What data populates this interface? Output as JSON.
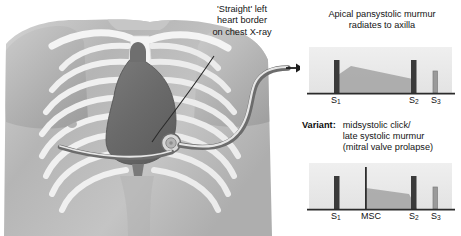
{
  "annotation": {
    "text": "'Straight' left\nheart border\non chest X-ray"
  },
  "anatomy": {
    "region_name": "anterior chest wall with heart silhouette",
    "stethoscope_position_label": "apex",
    "colors": {
      "skin": "#b9b9b9",
      "bone": "#f2f2f2",
      "heart": "#6e6e6e",
      "outline": "#4a4a4a"
    }
  },
  "panels": [
    {
      "id": "top",
      "title": "Apical pansystolic murmur\nradiates to axilla",
      "axis_labels": [
        {
          "text": "S",
          "sub": "1",
          "x": 26
        },
        {
          "text": "S",
          "sub": "2",
          "x": 104
        },
        {
          "text": "S",
          "sub": "3",
          "x": 126
        }
      ]
    },
    {
      "id": "bottom",
      "variant_label": "Variant:",
      "title": "midsystolic click/\nlate systolic murmur\n(mitral valve prolapse)",
      "axis_labels": [
        {
          "text": "S",
          "sub": "1",
          "x": 26
        },
        {
          "text": "MSC",
          "sub": "",
          "x": 56
        },
        {
          "text": "S",
          "sub": "2",
          "x": 104
        },
        {
          "text": "S",
          "sub": "3",
          "x": 126
        }
      ]
    }
  ],
  "chart_data": [
    {
      "type": "area",
      "id": "phonocardiogram-pansystolic",
      "title": "Apical pansystolic murmur radiates to axilla",
      "xlabel": "",
      "ylabel": "",
      "grid": false,
      "legend": "none",
      "xlim": [
        0,
        152
      ],
      "ylim": [
        0,
        48
      ],
      "baseline_y": 46,
      "events": [
        {
          "name": "S1",
          "x": 29,
          "width": 5.5,
          "height": 33,
          "shade": "#3a3a3a"
        },
        {
          "name": "S2",
          "x": 106,
          "width": 5.5,
          "height": 33,
          "shade": "#3a3a3a"
        },
        {
          "name": "S3",
          "x": 128,
          "width": 4.5,
          "height": 22,
          "shade": "#9a9a9a"
        }
      ],
      "murmur": {
        "name": "pansystolic murmur envelope",
        "shade": "#a8a8a8",
        "points": [
          [
            30,
            46
          ],
          [
            30,
            30
          ],
          [
            46,
            19
          ],
          [
            108,
            32
          ],
          [
            110,
            46
          ]
        ]
      }
    },
    {
      "type": "area",
      "id": "phonocardiogram-midsystolic-click",
      "title": "Variant: midsystolic click / late systolic murmur (mitral valve prolapse)",
      "xlabel": "",
      "ylabel": "",
      "grid": false,
      "legend": "none",
      "xlim": [
        0,
        152
      ],
      "ylim": [
        0,
        48
      ],
      "baseline_y": 46,
      "events": [
        {
          "name": "S1",
          "x": 29,
          "width": 5.5,
          "height": 33,
          "shade": "#3a3a3a"
        },
        {
          "name": "MSC",
          "x": 60,
          "width": 1.6,
          "height": 42,
          "shade": "#2e2e2e"
        },
        {
          "name": "S2",
          "x": 106,
          "width": 5.5,
          "height": 33,
          "shade": "#3a3a3a"
        },
        {
          "name": "S3",
          "x": 128,
          "width": 4.5,
          "height": 22,
          "shade": "#9a9a9a"
        }
      ],
      "murmur": {
        "name": "late systolic murmur envelope",
        "shade": "#a8a8a8",
        "points": [
          [
            61,
            46
          ],
          [
            61,
            25
          ],
          [
            104,
            31
          ],
          [
            112,
            46
          ]
        ]
      }
    }
  ],
  "connector": {
    "name": "stethoscope-tubing-arrow",
    "arrow_direction": "right",
    "color": "#222222"
  }
}
